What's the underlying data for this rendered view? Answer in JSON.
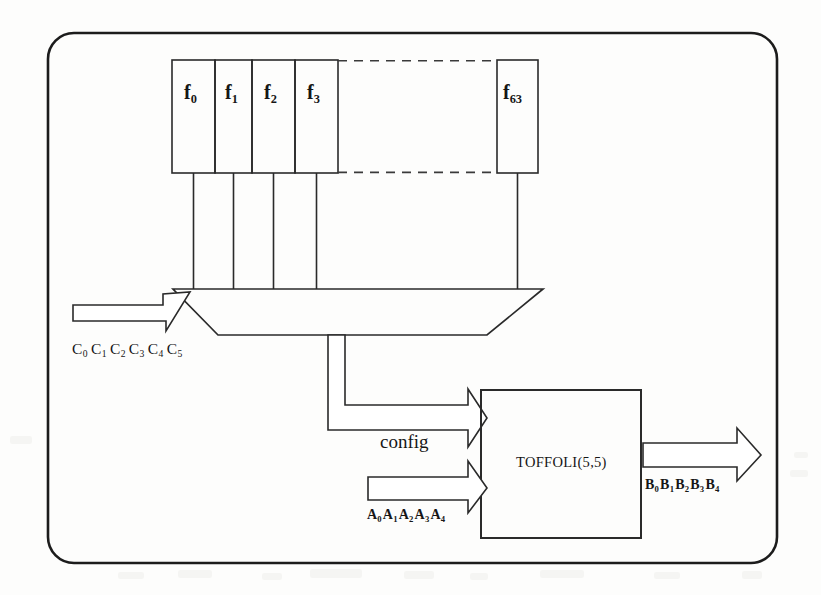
{
  "diagram": {
    "frame": {
      "name": "outer-rounded-frame"
    },
    "lut": {
      "name": "function-lookup-table",
      "cells": [
        {
          "id": "f0",
          "base": "f",
          "sub": "0",
          "x": 172,
          "w": 43
        },
        {
          "id": "f1",
          "base": "f",
          "sub": "1",
          "x": 215,
          "w": 37
        },
        {
          "id": "f2",
          "base": "f",
          "sub": "2",
          "x": 252,
          "w": 43
        },
        {
          "id": "f3",
          "base": "f",
          "sub": "3",
          "x": 295,
          "w": 43
        },
        {
          "id": "f63",
          "base": "f",
          "sub": "63",
          "x": 497,
          "w": 41
        }
      ],
      "ellipsis_style": "dashed",
      "top": 60,
      "bottom": 173
    },
    "mux": {
      "name": "multiplexer",
      "label": "",
      "select_label": "C",
      "select_bits": [
        "0",
        "1",
        "2",
        "3",
        "4",
        "5"
      ],
      "select_text": "C0 C1 C2 C3 C4 C5"
    },
    "config_arrow": {
      "name": "config-bus",
      "label": "config"
    },
    "toffoli": {
      "name": "toffoli-gate-block",
      "label": "TOFFOLI(5,5)"
    },
    "input_a": {
      "name": "a-input-bus",
      "base": "A",
      "bits": [
        "0",
        "1",
        "2",
        "3",
        "4"
      ],
      "text": "A0A1A2A3A4"
    },
    "output_b": {
      "name": "b-output-bus",
      "base": "B",
      "bits": [
        "0",
        "1",
        "2",
        "3",
        "4"
      ],
      "text": "B0B1B2B3B4"
    },
    "colors": {
      "ink": "#161616",
      "line": "#2a2a2a",
      "paper": "#fdfdfc"
    }
  }
}
